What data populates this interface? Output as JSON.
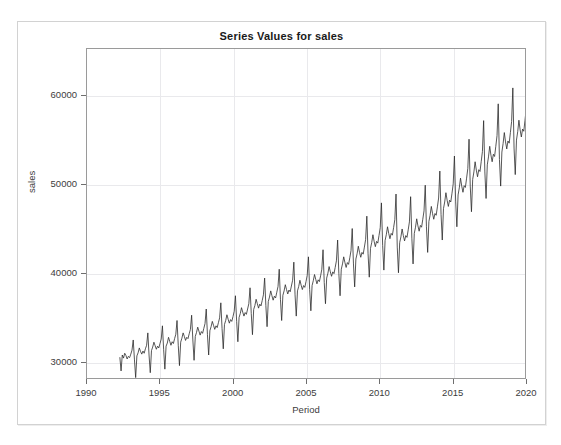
{
  "chart_window": {
    "title": "Series Values for sales"
  },
  "axes": {
    "x_title": "Period",
    "y_title": "sales",
    "x_ticks": [
      "1990",
      "1995",
      "2000",
      "2005",
      "2010",
      "2015",
      "2020"
    ],
    "y_ticks": [
      "30000",
      "40000",
      "50000",
      "60000"
    ]
  },
  "chart_data": {
    "type": "line",
    "title": "Series Values for sales",
    "xlabel": "Period",
    "ylabel": "sales",
    "xlim": [
      1990,
      2020
    ],
    "ylim": [
      28100,
      65300
    ],
    "grid": true,
    "legend": null,
    "x_tick_values": [
      1990,
      1995,
      2000,
      2005,
      2010,
      2015,
      2020
    ],
    "y_tick_values": [
      30000,
      40000,
      50000,
      60000
    ],
    "series_name": "sales",
    "line_color": "#2b2b2b",
    "frequency": "monthly",
    "x_start": 1992.25,
    "x_end": 1992.25,
    "x_step": 0.0833333,
    "y": [
      30450,
      28900,
      30700,
      30350,
      30900,
      30650,
      30250,
      30550,
      30400,
      30800,
      31250,
      32400,
      30150,
      28150,
      30600,
      30950,
      31500,
      31100,
      30800,
      31150,
      30900,
      31400,
      31800,
      33200,
      30700,
      28700,
      31200,
      31600,
      32150,
      31750,
      31350,
      31700,
      31500,
      32000,
      32500,
      34000,
      31300,
      29100,
      31700,
      32050,
      32700,
      32250,
      31800,
      32200,
      32000,
      32550,
      33050,
      34600,
      31800,
      29500,
      32150,
      32600,
      33200,
      32800,
      32350,
      32700,
      32550,
      33100,
      33600,
      35200,
      32400,
      30100,
      32800,
      33250,
      33850,
      33400,
      32950,
      33350,
      33150,
      33700,
      34250,
      35900,
      33000,
      30700,
      33450,
      33900,
      34500,
      34050,
      33600,
      34000,
      33800,
      34350,
      34900,
      36600,
      33700,
      31400,
      34150,
      34600,
      35250,
      34750,
      34300,
      34700,
      34500,
      35050,
      35650,
      37400,
      34500,
      32200,
      34950,
      35400,
      36050,
      35550,
      35100,
      35500,
      35300,
      35900,
      36500,
      38300,
      35400,
      33000,
      35850,
      36300,
      37000,
      36500,
      36000,
      36450,
      36250,
      36850,
      37500,
      39400,
      36300,
      33900,
      36750,
      37250,
      37950,
      37400,
      36900,
      37350,
      37150,
      37800,
      38450,
      40400,
      37000,
      34600,
      37450,
      37950,
      38650,
      38100,
      37600,
      38050,
      37850,
      38500,
      39150,
      41200,
      37500,
      35100,
      37950,
      38450,
      39150,
      38600,
      38100,
      38550,
      38350,
      39000,
      39700,
      41800,
      38100,
      35700,
      38550,
      39100,
      39800,
      39250,
      38750,
      39200,
      39000,
      39650,
      40400,
      42600,
      38900,
      36500,
      39400,
      39950,
      40700,
      40100,
      39600,
      40100,
      39900,
      40600,
      41350,
      43700,
      39900,
      37400,
      40400,
      41000,
      41800,
      41150,
      40600,
      41150,
      40950,
      41700,
      42500,
      45000,
      41000,
      38400,
      41550,
      42150,
      43000,
      42300,
      41750,
      42300,
      42100,
      42900,
      43750,
      46400,
      42200,
      39500,
      42750,
      43400,
      44300,
      43550,
      42950,
      43550,
      43350,
      44200,
      45100,
      47900,
      43100,
      40300,
      43650,
      44300,
      45200,
      44450,
      43850,
      44450,
      44250,
      45100,
      46000,
      48900,
      42900,
      40000,
      43400,
      44050,
      44950,
      44200,
      43600,
      44200,
      44000,
      44850,
      45750,
      48600,
      43900,
      41000,
      44450,
      45150,
      46100,
      45300,
      44700,
      45350,
      45150,
      46050,
      47000,
      49900,
      45200,
      42300,
      45800,
      46500,
      47500,
      46700,
      46050,
      46700,
      46500,
      47450,
      48450,
      51500,
      46600,
      43700,
      47250,
      48000,
      49050,
      48200,
      47500,
      48200,
      48000,
      49000,
      50050,
      53200,
      48100,
      45200,
      48800,
      49600,
      50700,
      49800,
      49100,
      49850,
      49650,
      50700,
      51800,
      55100,
      49800,
      46900,
      50550,
      51400,
      52550,
      51600,
      50850,
      51650,
      51450,
      52550,
      53700,
      57200,
      51400,
      48400,
      52200,
      53100,
      54300,
      53300,
      52550,
      53400,
      53150,
      54300,
      55500,
      59100,
      52800,
      49800,
      53650,
      54600,
      55850,
      54800,
      54000,
      54900,
      54650,
      55850,
      57100,
      60900,
      54100,
      51100,
      55000,
      55950,
      57250,
      56150,
      55350,
      56250,
      56000,
      57250,
      58550,
      62500,
      55300,
      52300,
      56200,
      57200,
      58550,
      57400,
      56600,
      57500,
      57250,
      58550,
      59900,
      64500,
      56600,
      54100,
      57500,
      58500,
      59850,
      58700,
      57900,
      58850,
      58600,
      59900,
      60450,
      60200,
      59300,
      59700,
      60350,
      60100,
      60500,
      60250,
      60400,
      60100
    ]
  }
}
